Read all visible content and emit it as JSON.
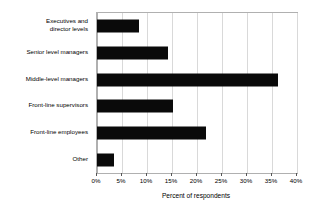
{
  "chart_data": {
    "type": "bar",
    "orientation": "horizontal",
    "title": "",
    "xlabel": "Percent of respondents",
    "ylabel": "",
    "xlim": [
      0,
      40
    ],
    "xtick_step": 5,
    "xtick_labels": [
      "0%",
      "5%",
      "10%",
      "15%",
      "20%",
      "25%",
      "30%",
      "35%",
      "40%"
    ],
    "xtick_values": [
      0,
      5,
      10,
      15,
      20,
      25,
      30,
      35,
      40
    ],
    "grid": "vertical",
    "legend": "none",
    "bar_color": "#0a0a0a",
    "gridline_color": "#d9d9d9",
    "frame_color": "#b0b0b0",
    "categories": [
      "Executives and\ndirector levels",
      "Senior level managers",
      "Middle-level managers",
      "Front-line supervisors",
      "Front-line employees",
      "Other"
    ],
    "values": [
      8.4,
      14.2,
      36.2,
      15.2,
      21.8,
      3.4
    ]
  }
}
